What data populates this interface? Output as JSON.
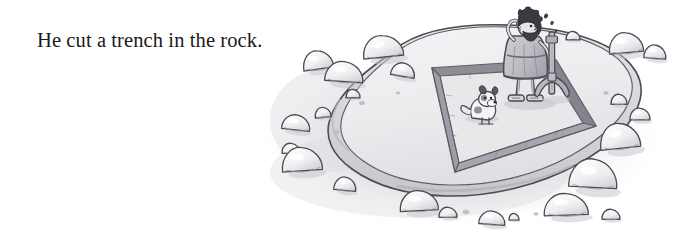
{
  "page": {
    "width": 693,
    "height": 238,
    "background_color": "#ffffff",
    "type": "illustrated-storybook-page"
  },
  "caption": {
    "text": "He cut a trench in the rock.",
    "color": "#1a1a1a",
    "font_size_px": 20.5,
    "style": "serif"
  },
  "illustration": {
    "name": "man-cutting-trench-in-rock",
    "style": "grayscale ink and wash cartoon",
    "description": "A bearded man in a tunic wipes his brow while holding a pickaxe, standing on a large flat rock where a rectangular trench has been cut around the perimeter. A small dog sits nearby. Boulders are scattered around the rock platform.",
    "palette": {
      "outline": "#4a4a52",
      "outline_soft": "#6e6e78",
      "trench_shadow": "#9a9aa2",
      "trench_shadow_dark": "#85858e",
      "rock_top": "#eeeef0",
      "rock_face": "#d8d8dc",
      "ground_shadow": "#c8c8cc",
      "ground_shadow_soft": "#dedee2",
      "tunic": "#c0c0c6",
      "tunic_shade": "#a8a8b0",
      "skin": "#e2e2e6",
      "hair": "#3a3a42",
      "dog_body": "#f2f2f4",
      "dog_spot": "#54545c",
      "boulder_fill": "#fafafa",
      "boulder_shade": "#d0d0d6",
      "metal": "#b4b4bc"
    },
    "elements": {
      "platform_label": "rock-platform",
      "trench_label": "cut-trench",
      "man_label": "man-with-pickaxe",
      "pickaxe_label": "pickaxe",
      "dog_label": "dog",
      "boulders_label": "scattered-boulders",
      "sweat_label": "sweat-droplets"
    },
    "boulders": [
      {
        "cx": 318,
        "cy": 63,
        "rx": 15,
        "ry": 11,
        "tilt": -8
      },
      {
        "cx": 344,
        "cy": 75,
        "rx": 19,
        "ry": 12,
        "tilt": 4
      },
      {
        "cx": 383,
        "cy": 50,
        "rx": 20,
        "ry": 13,
        "tilt": -6
      },
      {
        "cx": 403,
        "cy": 72,
        "rx": 12,
        "ry": 8,
        "tilt": 10
      },
      {
        "cx": 353,
        "cy": 95,
        "rx": 7,
        "ry": 5,
        "tilt": 0
      },
      {
        "cx": 323,
        "cy": 114,
        "rx": 8,
        "ry": 6,
        "tilt": -5
      },
      {
        "cx": 296,
        "cy": 125,
        "rx": 14,
        "ry": 9,
        "tilt": 6
      },
      {
        "cx": 291,
        "cy": 150,
        "rx": 9,
        "ry": 6,
        "tilt": 0
      },
      {
        "cx": 302,
        "cy": 163,
        "rx": 20,
        "ry": 14,
        "tilt": -4
      },
      {
        "cx": 345,
        "cy": 186,
        "rx": 11,
        "ry": 8,
        "tilt": 5
      },
      {
        "cx": 419,
        "cy": 204,
        "rx": 19,
        "ry": 12,
        "tilt": -3
      },
      {
        "cx": 448,
        "cy": 214,
        "rx": 9,
        "ry": 6,
        "tilt": 0
      },
      {
        "cx": 492,
        "cy": 220,
        "rx": 13,
        "ry": 8,
        "tilt": 4
      },
      {
        "cx": 514,
        "cy": 218,
        "rx": 5,
        "ry": 4,
        "tilt": 0
      },
      {
        "cx": 566,
        "cy": 208,
        "rx": 22,
        "ry": 13,
        "tilt": -2
      },
      {
        "cx": 611,
        "cy": 216,
        "rx": 9,
        "ry": 6,
        "tilt": 0
      },
      {
        "cx": 593,
        "cy": 178,
        "rx": 24,
        "ry": 17,
        "tilt": 3
      },
      {
        "cx": 620,
        "cy": 140,
        "rx": 20,
        "ry": 15,
        "tilt": -6
      },
      {
        "cx": 640,
        "cy": 116,
        "rx": 10,
        "ry": 7,
        "tilt": 0
      },
      {
        "cx": 619,
        "cy": 101,
        "rx": 8,
        "ry": 6,
        "tilt": 0
      },
      {
        "cx": 626,
        "cy": 46,
        "rx": 17,
        "ry": 12,
        "tilt": -5
      },
      {
        "cx": 655,
        "cy": 54,
        "rx": 11,
        "ry": 8,
        "tilt": 4
      },
      {
        "cx": 573,
        "cy": 37,
        "rx": 7,
        "ry": 5,
        "tilt": 0
      }
    ]
  }
}
